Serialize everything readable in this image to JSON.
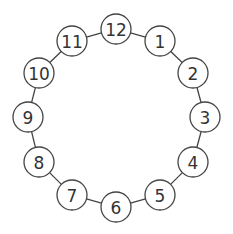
{
  "diagram": {
    "title": "",
    "type": "ring-of-numbered-nodes",
    "colors": {
      "stroke": "#444444",
      "text": "#333333",
      "fill": "#ffffff"
    },
    "radius": 15,
    "nodes": [
      {
        "label": "12",
        "x": 116,
        "y": 29
      },
      {
        "label": "1",
        "x": 160,
        "y": 41
      },
      {
        "label": "2",
        "x": 193,
        "y": 73
      },
      {
        "label": "3",
        "x": 205,
        "y": 117
      },
      {
        "label": "4",
        "x": 193,
        "y": 162
      },
      {
        "label": "5",
        "x": 160,
        "y": 195
      },
      {
        "label": "6",
        "x": 116,
        "y": 207
      },
      {
        "label": "7",
        "x": 72,
        "y": 195
      },
      {
        "label": "8",
        "x": 39,
        "y": 162
      },
      {
        "label": "9",
        "x": 28,
        "y": 117
      },
      {
        "label": "10",
        "x": 39,
        "y": 73
      },
      {
        "label": "11",
        "x": 72,
        "y": 41
      }
    ]
  }
}
